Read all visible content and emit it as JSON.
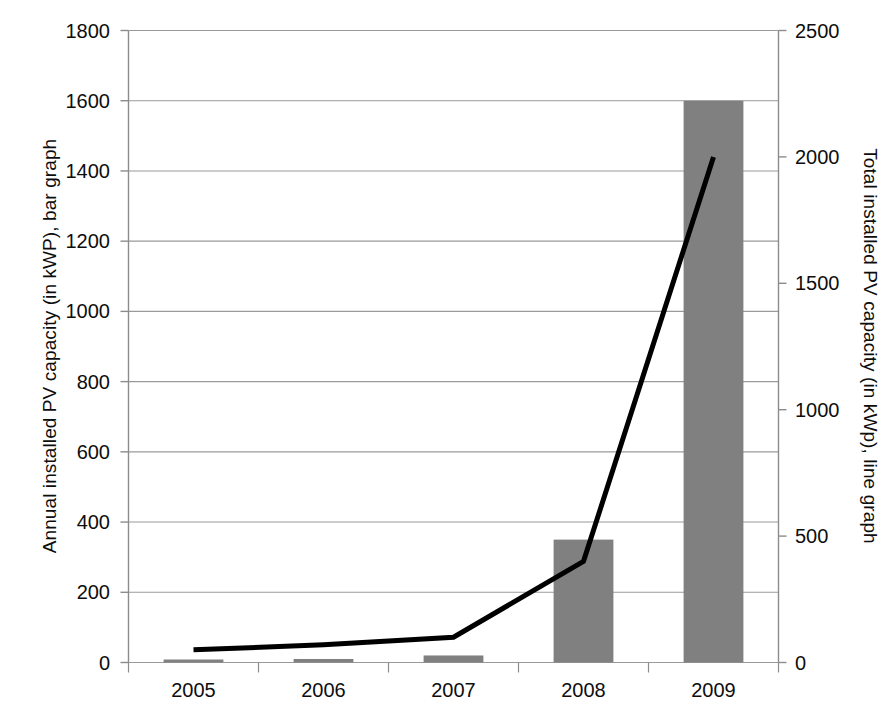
{
  "chart_data": {
    "type": "bar",
    "title": "",
    "categories": [
      "2005",
      "2006",
      "2007",
      "2008",
      "2009"
    ],
    "series": [
      {
        "name": "Annual installed PV capacity",
        "type": "bar",
        "axis": "left",
        "color": "#808080",
        "values": [
          5,
          10,
          20,
          350,
          1600
        ]
      },
      {
        "name": "Total installed PV capacity",
        "type": "line",
        "axis": "right",
        "color": "#000000",
        "values": [
          50,
          70,
          100,
          400,
          2000
        ]
      }
    ],
    "xlabel": "",
    "ylabel": "Annual installed PV capacity (in kWP), bar graph",
    "y2label": "Total installed PV capacity (in kWp), line graph",
    "ylim": [
      0,
      1800
    ],
    "y2lim": [
      0,
      2500
    ],
    "yticks": [
      0,
      200,
      400,
      600,
      800,
      1000,
      1200,
      1400,
      1600,
      1800
    ],
    "y2ticks": [
      0,
      500,
      1000,
      1500,
      2000,
      2500
    ],
    "grid": true,
    "legend": "none"
  },
  "axes": {
    "left_title": "Annual installed PV capacity (in kWP), bar graph",
    "right_title": "Total installed PV capacity (in kWp), line graph",
    "left_tick_labels": [
      "1800",
      "1600",
      "1400",
      "1200",
      "1000",
      "800",
      "600",
      "400",
      "200",
      "0"
    ],
    "right_tick_labels": [
      "2500",
      "2000",
      "1500",
      "1000",
      "500",
      "0"
    ],
    "x_tick_labels": [
      "2005",
      "2006",
      "2007",
      "2008",
      "2009"
    ]
  },
  "colors": {
    "bar_fill": "#808080",
    "line_stroke": "#000000",
    "grid": "#9a9a9a",
    "axis": "#8c8c8c",
    "background": "#ffffff"
  }
}
